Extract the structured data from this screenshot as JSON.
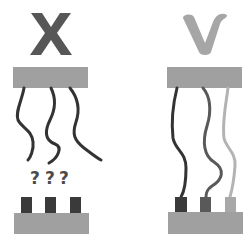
{
  "diagram": {
    "left_panel": {
      "label": "incorrect",
      "symbol": "X",
      "unknown_marks": [
        "?",
        "?",
        "?"
      ],
      "wire_count": 3,
      "pin_count": 3,
      "wires_connected": false
    },
    "right_panel": {
      "label": "correct",
      "symbol": "check",
      "wire_count": 3,
      "pin_count": 3,
      "wires_connected": true
    },
    "colors": {
      "background": "#ffffff",
      "bar": "#a0a0a0",
      "x_symbol": "#575757",
      "check_symbol": "#a6a6a6",
      "wire_dark": "#333333",
      "wire_medium": "#595959",
      "wire_light": "#b3b3b3",
      "pin_dark": "#3a3a3a",
      "pin_medium": "#595959",
      "pin_light": "#a8a8a8",
      "question_mark": "#4a4a4a"
    }
  }
}
